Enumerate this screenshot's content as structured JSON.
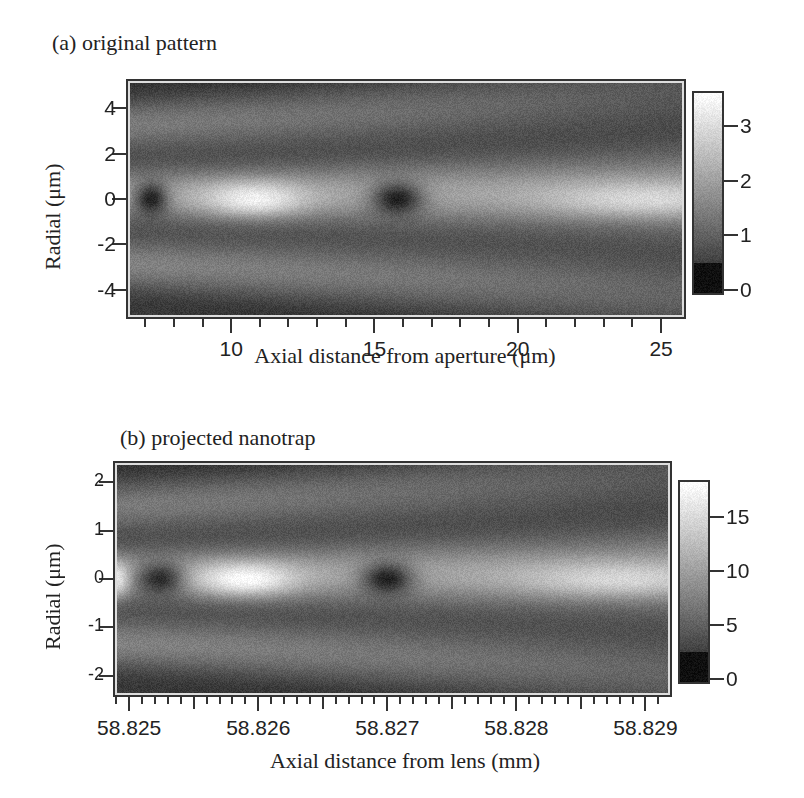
{
  "chart_data": [
    {
      "type": "heatmap",
      "title": "(a) original pattern",
      "xlabel": "Axial distance from aperture (μm)",
      "ylabel": "Radial (μm)",
      "xlim": [
        6.4,
        25.8
      ],
      "ylim": [
        -5.2,
        5.2
      ],
      "x_ticks": [
        10,
        15,
        20,
        25
      ],
      "x_tick_labels": [
        "10",
        "15",
        "20",
        "25"
      ],
      "x_minor_ticks": [
        7,
        8,
        9,
        11,
        12,
        13,
        14,
        16,
        17,
        18,
        19,
        21,
        22,
        23,
        24
      ],
      "y_ticks": [
        4,
        2,
        0,
        -2,
        -4
      ],
      "y_tick_labels": [
        "4",
        "2",
        "0",
        "-2",
        "-4"
      ],
      "colorbar": {
        "range": [
          -0.05,
          3.6
        ],
        "ticks": [
          3,
          2,
          1,
          0
        ],
        "tick_labels": [
          "3",
          "2",
          "1",
          "0"
        ],
        "colormap": "grayscale"
      },
      "features": [
        {
          "kind": "minimum",
          "x": 7.2,
          "y": 0,
          "value": 0.1
        },
        {
          "kind": "maximum",
          "x": 10.8,
          "y": 0,
          "value": 3.4
        },
        {
          "kind": "minimum",
          "x": 15.8,
          "y": 0,
          "value": 0.1
        },
        {
          "kind": "maximum",
          "x": 24.5,
          "y": 0,
          "value": 3.0
        }
      ]
    },
    {
      "type": "heatmap",
      "title": "(b) projected nanotrap",
      "xlabel": "Axial distance from lens (mm)",
      "ylabel": "Radial (μm)",
      "xlim": [
        58.82489,
        58.82919
      ],
      "ylim": [
        -2.4,
        2.4
      ],
      "x_ticks": [
        58.825,
        58.826,
        58.827,
        58.828,
        58.829
      ],
      "x_tick_labels": [
        "58.825",
        "58.826",
        "58.827",
        "58.828",
        "58.829"
      ],
      "x_minor_step": 0.0001,
      "y_ticks": [
        2,
        1,
        0,
        -1,
        -2
      ],
      "y_tick_labels": [
        "2",
        "1",
        "0",
        "-1",
        "-2"
      ],
      "colorbar": {
        "range": [
          -0.3,
          18.2
        ],
        "ticks": [
          15,
          10,
          5,
          0
        ],
        "tick_labels": [
          "15",
          "10",
          "5",
          "0"
        ],
        "colormap": "grayscale"
      },
      "features": [
        {
          "kind": "maximum",
          "x": 58.8249,
          "y": 0,
          "value": 17
        },
        {
          "kind": "minimum",
          "x": 58.82525,
          "y": 0,
          "value": 0.5
        },
        {
          "kind": "maximum",
          "x": 58.8259,
          "y": 0,
          "value": 18
        },
        {
          "kind": "minimum",
          "x": 58.827,
          "y": 0,
          "value": 0.5
        },
        {
          "kind": "maximum",
          "x": 58.8288,
          "y": 0,
          "value": 15
        }
      ]
    }
  ]
}
